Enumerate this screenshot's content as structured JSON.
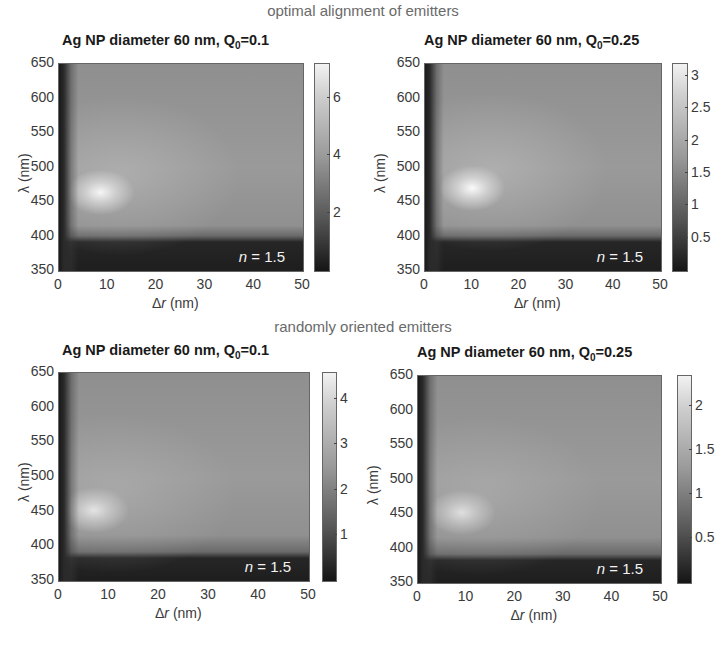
{
  "section_titles": {
    "top": "optimal alignment of emitters",
    "bottom": "randomly oriented emitters"
  },
  "chart_data": [
    {
      "type": "heatmap",
      "group": "optimal alignment of emitters",
      "title": "Ag NP diameter 60 nm, Q0=0.1",
      "title_main": "Ag NP diameter 60 nm, Q",
      "title_sub": "0",
      "title_tail": "=0.1",
      "xlabel": "Δr (nm)",
      "xlabel_sym": "Δ",
      "xlabel_var": "r",
      "xlabel_unit": " (nm)",
      "ylabel": "λ (nm)",
      "xlim": [
        0,
        50
      ],
      "ylim": [
        350,
        650
      ],
      "xticks": [
        "0",
        "10",
        "20",
        "30",
        "40",
        "50"
      ],
      "yticks": [
        "650",
        "600",
        "550",
        "500",
        "450",
        "400",
        "350"
      ],
      "colorbar": {
        "range": [
          0,
          7.2
        ],
        "ticks": [
          "6",
          "4",
          "2"
        ],
        "colormap": "gray"
      },
      "annotation": "n = 1.5",
      "annotation_var": "n",
      "annotation_val": " = 1.5",
      "peak": {
        "x": 8,
        "y": 465,
        "value": 7.0
      },
      "features": "bright maximum near Δr≈8 nm, λ≈465 nm; dark band below λ≈385 nm and at Δr<2 nm"
    },
    {
      "type": "heatmap",
      "group": "optimal alignment of emitters",
      "title": "Ag NP diameter 60 nm, Q0=0.25",
      "title_main": "Ag NP diameter 60 nm, Q",
      "title_sub": "0",
      "title_tail": "=0.25",
      "xlabel": "Δr (nm)",
      "xlabel_sym": "Δ",
      "xlabel_var": "r",
      "xlabel_unit": " (nm)",
      "ylabel": "λ (nm)",
      "xlim": [
        0,
        50
      ],
      "ylim": [
        350,
        650
      ],
      "xticks": [
        "0",
        "10",
        "20",
        "30",
        "40",
        "50"
      ],
      "yticks": [
        "650",
        "600",
        "550",
        "500",
        "450",
        "400",
        "350"
      ],
      "colorbar": {
        "range": [
          0,
          3.2
        ],
        "ticks": [
          "3",
          "2.5",
          "2",
          "1.5",
          "1",
          "0.5"
        ],
        "colormap": "gray"
      },
      "annotation": "n = 1.5",
      "annotation_var": "n",
      "annotation_val": " = 1.5",
      "peak": {
        "x": 10,
        "y": 470,
        "value": 3.1
      },
      "features": "broad bright maximum near Δr≈10 nm, λ≈470 nm; dark band below λ≈385 nm"
    },
    {
      "type": "heatmap",
      "group": "randomly oriented emitters",
      "title": "Ag NP diameter 60 nm, Q0=0.1",
      "title_main": "Ag NP diameter 60 nm, Q",
      "title_sub": "0",
      "title_tail": "=0.1",
      "xlabel": "Δr (nm)",
      "xlabel_sym": "Δ",
      "xlabel_var": "r",
      "xlabel_unit": " (nm)",
      "ylabel": "λ (nm)",
      "xlim": [
        0,
        50
      ],
      "ylim": [
        350,
        650
      ],
      "xticks": [
        "0",
        "10",
        "20",
        "30",
        "40",
        "50"
      ],
      "yticks": [
        "650",
        "600",
        "550",
        "500",
        "450",
        "400",
        "350"
      ],
      "colorbar": {
        "range": [
          0,
          4.6
        ],
        "ticks": [
          "4",
          "3",
          "2",
          "1"
        ],
        "colormap": "gray"
      },
      "annotation": "n = 1.5",
      "annotation_var": "n",
      "annotation_val": " = 1.5",
      "peak": {
        "x": 7,
        "y": 450,
        "value": 4.4
      },
      "features": "compact bright maximum near Δr≈7 nm, λ≈450 nm"
    },
    {
      "type": "heatmap",
      "group": "randomly oriented emitters",
      "title": "Ag NP diameter 60 nm, Q0=0.25",
      "title_main": "Ag NP diameter 60 nm, Q",
      "title_sub": "0",
      "title_tail": "=0.25",
      "xlabel": "Δr (nm)",
      "xlabel_sym": "Δ",
      "xlabel_var": "r",
      "xlabel_unit": " (nm)",
      "ylabel": "λ (nm)",
      "xlim": [
        0,
        50
      ],
      "ylim": [
        350,
        650
      ],
      "xticks": [
        "0",
        "10",
        "20",
        "30",
        "40",
        "50"
      ],
      "yticks": [
        "650",
        "600",
        "550",
        "500",
        "450",
        "400",
        "350"
      ],
      "colorbar": {
        "range": [
          0,
          2.35
        ],
        "ticks": [
          "2",
          "1.5",
          "1",
          "0.5"
        ],
        "colormap": "gray"
      },
      "annotation": "n = 1.5",
      "annotation_var": "n",
      "annotation_val": " = 1.5",
      "peak": {
        "x": 9,
        "y": 450,
        "value": 2.3
      },
      "features": "bright maximum near Δr≈9 nm, λ≈450 nm; dark at Δr<3 nm"
    }
  ]
}
